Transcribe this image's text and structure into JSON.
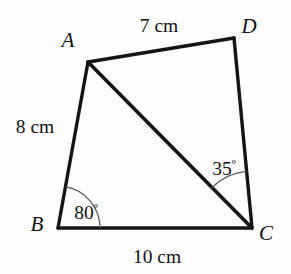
{
  "figure": {
    "kind": "geometry-diagram",
    "shape": "quadrilateral",
    "name": "ABCD",
    "background_color": "#fdfdfd",
    "stroke_color": "#141414",
    "arc_color": "#5a5a5a"
  },
  "vertices": {
    "A": {
      "label": "A",
      "x": 88,
      "y": 62,
      "label_x": 68,
      "label_y": 47
    },
    "B": {
      "label": "B",
      "x": 58,
      "y": 228,
      "label_x": 37,
      "label_y": 231
    },
    "C": {
      "label": "C",
      "x": 252,
      "y": 228,
      "label_x": 261,
      "label_y": 240
    },
    "D": {
      "label": "D",
      "x": 234,
      "y": 38,
      "label_x": 243,
      "label_y": 33
    }
  },
  "edges": [
    {
      "name": "side-AD",
      "from": "A",
      "to": "D",
      "measure": "7 cm"
    },
    {
      "name": "side-AB",
      "from": "A",
      "to": "B",
      "measure": "8 cm"
    },
    {
      "name": "side-BC",
      "from": "B",
      "to": "C",
      "measure": "10 cm"
    },
    {
      "name": "side-DC",
      "from": "D",
      "to": "C",
      "measure": ""
    },
    {
      "name": "diagonal-AC",
      "from": "A",
      "to": "C",
      "measure": ""
    }
  ],
  "measures": {
    "ad": {
      "text": "7 cm",
      "x": 159,
      "y": 32
    },
    "ab": {
      "text": "8 cm",
      "x": 35,
      "y": 133
    },
    "bc": {
      "text": "10 cm",
      "x": 157,
      "y": 262
    }
  },
  "angles": {
    "at_b": {
      "text": "80",
      "degree": "º",
      "value": 80,
      "vertex": "B",
      "between": "BA and BC",
      "label_x": 86,
      "label_y": 219,
      "arc_radius": 42
    },
    "at_c": {
      "text": "35",
      "degree": "º",
      "value": 35,
      "vertex": "C",
      "between": "CA and CD",
      "label_x": 224,
      "label_y": 174,
      "arc_radius": 57
    }
  }
}
